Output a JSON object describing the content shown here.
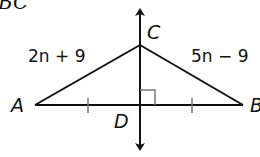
{
  "header": {
    "partial_title": "BC"
  },
  "diagram": {
    "stroke_color": "#111111",
    "tick_color": "#777777",
    "vertices": {
      "A": {
        "label": "A",
        "x": 35,
        "y": 105
      },
      "B": {
        "label": "B",
        "x": 243,
        "y": 105
      },
      "C": {
        "label": "C",
        "x": 140,
        "y": 45
      },
      "D": {
        "label": "D",
        "x": 140,
        "y": 105
      }
    },
    "side_labels": {
      "AC": "2n + 9",
      "BC": "5n − 9"
    },
    "markings": {
      "congruent_ticks": [
        "AD",
        "DB"
      ],
      "right_angle_at": "D"
    },
    "perpendicular_line": {
      "name": "line CD",
      "arrows": "both"
    }
  }
}
